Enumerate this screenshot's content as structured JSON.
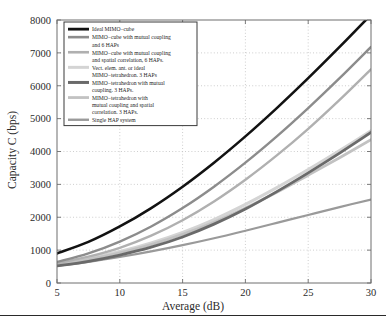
{
  "figure": {
    "background_color": "#ffffff",
    "frame_color": "#6e6e6e",
    "grid_color": "#b9b9b9",
    "bottom_rule_color": "#2a2a2a"
  },
  "chart_data": {
    "type": "line",
    "title": "",
    "xlabel": "Average (dB)",
    "ylabel": "Capacity C (bps)",
    "xlim": [
      5,
      30
    ],
    "ylim": [
      0,
      8000
    ],
    "xticks": [
      5,
      10,
      15,
      20,
      25,
      30
    ],
    "xtick_labels": [
      "5",
      "10",
      "15",
      "20",
      "25",
      "30"
    ],
    "yticks": [
      0,
      1000,
      2000,
      3000,
      4000,
      5000,
      6000,
      7000,
      8000
    ],
    "ytick_labels": [
      "0",
      "1000",
      "2000",
      "3000",
      "4000",
      "5000",
      "6000",
      "7000",
      "8000"
    ],
    "grid": true,
    "grid_style": "dotted",
    "legend_position": "upper left",
    "x": [
      5,
      7.5,
      10,
      12.5,
      15,
      17.5,
      20,
      22.5,
      25,
      27.5,
      30
    ],
    "series": [
      {
        "name": "Ideal MIMO-cube",
        "color": "#121212",
        "width": 2.6,
        "values": [
          900,
          1250,
          1720,
          2280,
          2930,
          3660,
          4460,
          5320,
          6230,
          7180,
          8160
        ]
      },
      {
        "name": "MIMO-cube with mutual coupling and 6 HAPs",
        "color": "#8c8c8c",
        "width": 2.4,
        "values": [
          640,
          900,
          1260,
          1720,
          2280,
          2930,
          3660,
          4460,
          5320,
          6230,
          7180
        ]
      },
      {
        "name": "MIMO-cube with mutual coupling and spatial correlation, 6 HAPs.",
        "color": "#b0b0b0",
        "width": 2.4,
        "values": [
          600,
          800,
          1070,
          1440,
          1910,
          2480,
          3140,
          3880,
          4690,
          5570,
          6500
        ]
      },
      {
        "name": "Vect. elem. ant. or ideal MIMO-tetrahedron.  3 HAPs",
        "color": "#d4d4d4",
        "width": 3.0,
        "values": [
          600,
          760,
          960,
          1220,
          1540,
          1930,
          2390,
          2900,
          3450,
          4030,
          4630
        ]
      },
      {
        "name": "MIMO-tetrahedron with mutual coupling. 3 HAPs.",
        "color": "#6a6a6a",
        "width": 2.8,
        "values": [
          520,
          660,
          850,
          1090,
          1400,
          1790,
          2250,
          2780,
          3350,
          3950,
          4580
        ]
      },
      {
        "name": "MIMO-tetrahedron with mutual coupling and spatial correlation. 3 HAPs.",
        "color": "#c2c2c2",
        "width": 2.8,
        "values": [
          560,
          720,
          920,
          1170,
          1480,
          1850,
          2280,
          2760,
          3280,
          3810,
          4360
        ]
      },
      {
        "name": "Single HAP system",
        "color": "#9a9a9a",
        "width": 2.2,
        "values": [
          520,
          640,
          790,
          960,
          1150,
          1360,
          1590,
          1830,
          2070,
          2310,
          2540
        ]
      }
    ]
  },
  "legend": {
    "entries": [
      {
        "label_lines": [
          "Ideal MIMO−cube"
        ],
        "color": "#121212",
        "width": 2.8
      },
      {
        "label_lines": [
          "MIMO−cube with mutual coupling",
          "and 6 HAPs"
        ],
        "color": "#8c8c8c",
        "width": 2.6
      },
      {
        "label_lines": [
          "MIMO−cube with mutual coupling",
          "and spatial correlation, 6 HAPs."
        ],
        "color": "#b0b0b0",
        "width": 2.6
      },
      {
        "label_lines": [
          "Vect. elem. ant. or ideal",
          "MIMO−tetrahedron.  3 HAPs"
        ],
        "color": "#d4d4d4",
        "width": 3.0
      },
      {
        "label_lines": [
          "MIMO−tetrahedron with mutual",
          "coupling. 3 HAPs."
        ],
        "color": "#6a6a6a",
        "width": 3.0
      },
      {
        "label_lines": [
          "MIMO−tetrahedron with",
          "mutual coupling and spatial",
          "correlation. 3 HAPs."
        ],
        "color": "#c2c2c2",
        "width": 2.8
      },
      {
        "label_lines": [
          "Single HAP system"
        ],
        "color": "#9a9a9a",
        "width": 2.4
      }
    ]
  }
}
